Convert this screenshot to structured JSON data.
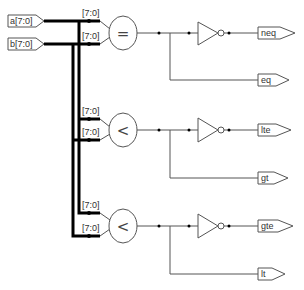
{
  "inputs": [
    {
      "name": "a[7:0]"
    },
    {
      "name": "b[7:0]"
    }
  ],
  "comparators": [
    {
      "op": "=",
      "in_a_label": "[7:0]",
      "in_b_label": "[7:0]",
      "out_inverted": "neq",
      "out_direct": "eq"
    },
    {
      "op": "<",
      "in_a_label": "[7:0]",
      "in_b_label": "[7:0]",
      "out_inverted": "lte",
      "out_direct": "gt"
    },
    {
      "op": "<",
      "in_a_label": "[7:0]",
      "in_b_label": "[7:0]",
      "out_inverted": "gte",
      "out_direct": "lt"
    }
  ]
}
